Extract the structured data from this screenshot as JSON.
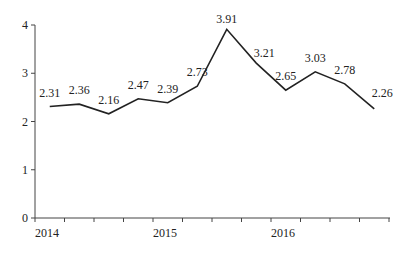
{
  "chart_data": {
    "type": "line",
    "title": "",
    "xlabel": "",
    "ylabel": "",
    "ylim": [
      0,
      4
    ],
    "yticks": [
      "0",
      "1",
      "2",
      "3",
      "4"
    ],
    "xtick_labels": [
      "2014",
      "2015",
      "2016"
    ],
    "grid": false,
    "legend": null,
    "series": [
      {
        "name": "value",
        "values": [
          2.31,
          2.36,
          2.16,
          2.47,
          2.39,
          2.73,
          3.91,
          3.21,
          2.65,
          3.03,
          2.78,
          2.26
        ]
      }
    ],
    "data_labels": [
      "2.31",
      "2.36",
      "2.16",
      "2.47",
      "2.39",
      "2.73",
      "3.91",
      "3.21",
      "2.65",
      "3.03",
      "2.78",
      "2.26"
    ]
  }
}
